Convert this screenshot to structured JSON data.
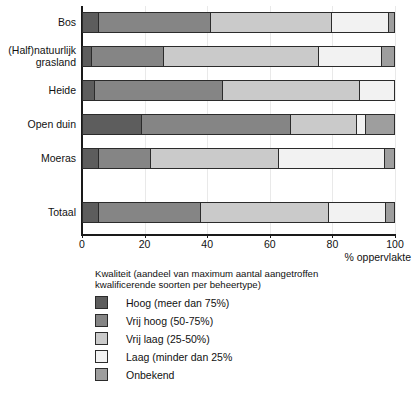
{
  "chart_data": {
    "type": "bar",
    "orientation": "horizontal",
    "stacked": true,
    "stack_mode": "percent",
    "title": "",
    "xlabel": "% oppervlakte",
    "ylabel": "",
    "xlim": [
      0,
      100
    ],
    "xticks": [
      0,
      20,
      40,
      60,
      80,
      100
    ],
    "grid": true,
    "grid_axis": "x",
    "legend_position": "below",
    "legend_title": "Kwaliteit (aandeel van maximum aantal aangetroffen\nkwalificerende soorten per beheertype)",
    "categories": [
      "Bos",
      "(Half)natuurlijk\ngrasland",
      "Heide",
      "Open duin",
      "Moeras",
      "Totaal"
    ],
    "series": [
      {
        "name": "Hoog (meer dan 75%)",
        "color": "#5d5d5d",
        "values": [
          5,
          3,
          4,
          19,
          5,
          5
        ]
      },
      {
        "name": "Vrij hoog (50-75%)",
        "color": "#858585",
        "values": [
          36,
          23,
          41,
          48,
          17,
          33
        ]
      },
      {
        "name": "Vrij laag (25-50%)",
        "color": "#cacaca",
        "values": [
          39,
          50,
          44,
          21,
          41,
          41
        ]
      },
      {
        "name": "Laag (minder dan 25%",
        "color": "#f2f2f2",
        "values": [
          18.5,
          20,
          11,
          3,
          34,
          18.5
        ]
      },
      {
        "name": "Onbekend",
        "color": "#9e9e9e",
        "values": [
          1.5,
          4,
          0,
          9,
          3,
          2.5
        ]
      }
    ]
  },
  "axis": {
    "x_title": "% oppervlakte",
    "tick_labels": [
      "0",
      "20",
      "40",
      "60",
      "80",
      "100"
    ]
  },
  "legend": {
    "title": "Kwaliteit (aandeel van maximum aantal aangetroffen\nkwalificerende soorten per beheertype)",
    "items": [
      {
        "label": "Hoog (meer dan 75%)",
        "color": "#5d5d5d"
      },
      {
        "label": "Vrij hoog (50-75%)",
        "color": "#858585"
      },
      {
        "label": "Vrij laag (25-50%)",
        "color": "#cacaca"
      },
      {
        "label": "Laag (minder dan 25%",
        "color": "#f2f2f2"
      },
      {
        "label": "Onbekend",
        "color": "#9e9e9e"
      }
    ]
  },
  "caption": ""
}
